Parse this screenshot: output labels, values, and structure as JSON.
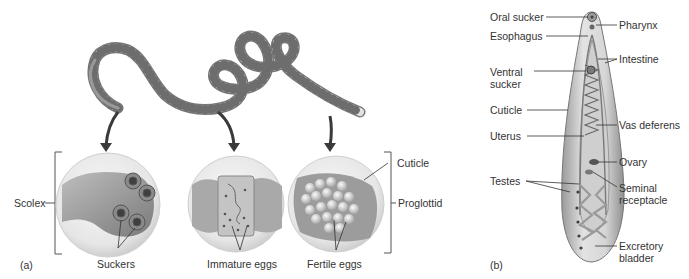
{
  "figure": {
    "panel_a": {
      "panel_label": "(a)",
      "title_implied": "Tapeworm",
      "labels": {
        "scolex": "Scolex",
        "suckers": "Suckers",
        "immature_eggs": "Immature eggs",
        "fertile_eggs": "Fertile eggs",
        "cuticle": "Cuticle",
        "proglottid": "Proglottid"
      }
    },
    "panel_b": {
      "panel_label": "(b)",
      "labels_left": {
        "oral_sucker": "Oral sucker",
        "esophagus": "Esophagus",
        "ventral_sucker_1": "Ventral",
        "ventral_sucker_2": "sucker",
        "cuticle": "Cuticle",
        "uterus": "Uterus",
        "testes": "Testes"
      },
      "labels_right": {
        "pharynx": "Pharynx",
        "intestine": "Intestine",
        "vas_deferens": "Vas deferens",
        "ovary": "Ovary",
        "seminal_receptacle_1": "Seminal",
        "seminal_receptacle_2": "receptacle",
        "excretory_bladder_1": "Excretory",
        "excretory_bladder_2": "bladder"
      }
    },
    "colors": {
      "line": "#333333",
      "worm_light": "#e4e4e4",
      "worm_dark": "#8a8a8a",
      "circle_fill": "#ececec",
      "arrow": "#3a3a3a"
    }
  }
}
